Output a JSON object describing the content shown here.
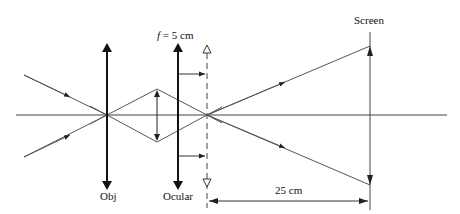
{
  "diagram": {
    "labels": {
      "objective": "Obj",
      "ocular": "Ocular",
      "screen": "Screen",
      "focal_symbol": "f",
      "focal_value": " = 5 cm",
      "distance": "25 cm"
    },
    "colors": {
      "line": "#555555",
      "lens": "#111111",
      "text": "#111111",
      "background": "#ffffff"
    },
    "elements": [
      {
        "id": "optical-axis",
        "type": "line"
      },
      {
        "id": "objective-lens",
        "type": "double-arrow",
        "label": "Obj"
      },
      {
        "id": "ocular-lens",
        "type": "double-arrow",
        "label": "Ocular"
      },
      {
        "id": "focal-plane",
        "type": "dashed-line",
        "label": "f = 5 cm"
      },
      {
        "id": "intermediate-image",
        "type": "double-arrow"
      },
      {
        "id": "screen",
        "type": "line",
        "label": "Screen"
      },
      {
        "id": "distance-marker",
        "type": "dimension",
        "label": "25 cm"
      }
    ]
  }
}
